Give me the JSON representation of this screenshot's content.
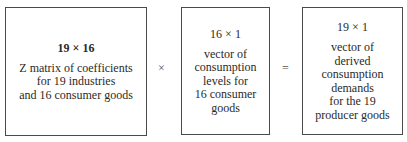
{
  "boxes": [
    {
      "dimension": "19 × 16",
      "lines": [
        "Z matrix of coefficients",
        "for 19 industries",
        "and 16 consumer goods"
      ]
    },
    {
      "dimension": "16 × 1",
      "lines": [
        "vector of",
        "consumption",
        "levels for",
        "16 consumer",
        "goods"
      ]
    },
    {
      "dimension": "19 × 1",
      "lines": [
        "vector of",
        "derived",
        "consumption",
        "demands",
        "for the 19",
        "producer goods"
      ]
    }
  ],
  "operators": [
    "×",
    "="
  ]
}
